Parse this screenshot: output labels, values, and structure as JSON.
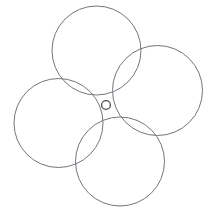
{
  "figure": {
    "background_color": "#ffffff",
    "width": 212,
    "height": 213,
    "stroke_color": "#74747c",
    "stroke_color_dark": "#4a4a50",
    "stroke_width": 1,
    "center_x": 106,
    "center_y": 105
  },
  "chart_data": {
    "type": "scatter",
    "xlabel": "",
    "ylabel": "",
    "xlim": [
      0,
      212
    ],
    "ylim": [
      0,
      213
    ],
    "grid": false,
    "legend": "none",
    "annotations": [
      "Four equal large circles arranged about a common center",
      "Adjacent circles intersect pairwise forming a curvilinear square at the middle",
      "A small circle sits at the common center"
    ],
    "series": [
      {
        "name": "top-circle",
        "shape": "circle",
        "cx": 96.5,
        "cy": 50.5,
        "r": 44.5,
        "stroke": "#74747c"
      },
      {
        "name": "right-circle",
        "shape": "circle",
        "cx": 157.5,
        "cy": 90.5,
        "r": 45.0,
        "stroke": "#74747c"
      },
      {
        "name": "left-circle",
        "shape": "circle",
        "cx": 58.5,
        "cy": 123.0,
        "r": 44.5,
        "stroke": "#74747c"
      },
      {
        "name": "bottom-circle",
        "shape": "circle",
        "cx": 120.0,
        "cy": 161.5,
        "r": 44.5,
        "stroke": "#74747c"
      },
      {
        "name": "center-circle",
        "shape": "circle",
        "cx": 106.0,
        "cy": 105.0,
        "r": 4.4,
        "stroke": "#4a4a50"
      }
    ]
  }
}
